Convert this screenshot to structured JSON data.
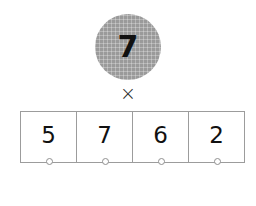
{
  "problem": {
    "multiplier": {
      "value": "7",
      "token_shape": "circle",
      "token_fill": "#9a9a9a",
      "token_texture": "grid-mesh"
    },
    "operator": {
      "label": "×",
      "name": "multiplication-sign"
    },
    "multiplicand": {
      "digits": [
        {
          "value": "5",
          "place": "thousands",
          "anchor": "anchor-dot"
        },
        {
          "value": "7",
          "place": "hundreds",
          "anchor": "anchor-dot"
        },
        {
          "value": "6",
          "place": "tens",
          "anchor": "anchor-dot"
        },
        {
          "value": "2",
          "place": "ones",
          "anchor": "anchor-dot"
        }
      ]
    }
  },
  "colors": {
    "background": "#ffffff",
    "border": "#9c9c9c",
    "digit": "#111111",
    "token": "#9a9a9a",
    "anchor_stroke": "#8f8f8f"
  }
}
